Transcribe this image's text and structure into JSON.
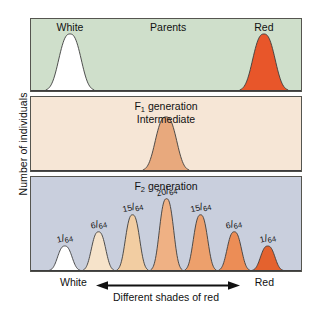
{
  "figure": {
    "y_axis_label": "Number of individuals",
    "x_axis": {
      "left_label": "White",
      "right_label": "Red",
      "caption": "Different shades of red",
      "arrow": "double-headed-arrow"
    }
  },
  "panels": [
    {
      "id": "parents",
      "background": "#cfdfcb",
      "title": "Parents",
      "labels": [
        {
          "text": "White",
          "x_pct": 14.7
        },
        {
          "text": "Parents",
          "x_pct": 50.8
        },
        {
          "text": "Red",
          "x_pct": 86.0
        }
      ],
      "curves": [
        {
          "name": "white-parent-curve",
          "center_pct": 14.7,
          "fill": "#ffffff",
          "height_pct": 78
        },
        {
          "name": "red-parent-curve",
          "center_pct": 86.0,
          "fill": "#e8562a",
          "height_pct": 78
        }
      ]
    },
    {
      "id": "f1",
      "background": "#f6e6d6",
      "title_line1": "F",
      "title_sub1": "1",
      "title_line1_rest": " generation",
      "title_line2": "Intermediate",
      "curves": [
        {
          "name": "f1-intermediate-curve",
          "center_pct": 50.0,
          "fill": "#e8a97d",
          "height_pct": 72
        }
      ]
    },
    {
      "id": "f2",
      "background": "#c9cfdd",
      "title_line1": "F",
      "title_sub1": "2",
      "title_line1_rest": " generation",
      "curves": [
        {
          "name": "f2-curve-1",
          "label_num": "1",
          "label_den": "64",
          "center_pct": 12.8,
          "fill": "#ffffff",
          "height_pct": 26
        },
        {
          "name": "f2-curve-2",
          "label_num": "6",
          "label_den": "64",
          "center_pct": 25.2,
          "fill": "#f6e3ca",
          "height_pct": 41
        },
        {
          "name": "f2-curve-3",
          "label_num": "15",
          "label_den": "64",
          "center_pct": 37.7,
          "fill": "#f2cda2",
          "height_pct": 59
        },
        {
          "name": "f2-curve-4",
          "label_num": "20",
          "label_den": "64",
          "center_pct": 50.2,
          "fill": "#efb184",
          "height_pct": 76
        },
        {
          "name": "f2-curve-5",
          "label_num": "15",
          "label_den": "64",
          "center_pct": 62.7,
          "fill": "#eda06c",
          "height_pct": 59
        },
        {
          "name": "f2-curve-6",
          "label_num": "6",
          "label_den": "64",
          "center_pct": 75.1,
          "fill": "#ec8d56",
          "height_pct": 41
        },
        {
          "name": "f2-curve-7",
          "label_num": "1",
          "label_den": "64",
          "center_pct": 87.4,
          "fill": "#e4622e",
          "height_pct": 26
        }
      ]
    }
  ],
  "chart_data": {
    "type": "area",
    "xlabel": "Different shades of red",
    "ylabel": "Number of individuals",
    "x_axis_endpoints": [
      "White",
      "Red"
    ],
    "series": [
      {
        "name": "Parents",
        "panel": "parents",
        "categories": [
          "White",
          "Red"
        ],
        "values": [
          1,
          1
        ],
        "positions_pct": [
          14.7,
          86.0
        ]
      },
      {
        "name": "F1 generation (Intermediate)",
        "panel": "f1",
        "categories": [
          "Intermediate"
        ],
        "values": [
          1
        ],
        "positions_pct": [
          50.0
        ]
      },
      {
        "name": "F2 generation",
        "panel": "f2",
        "categories": [
          "1/64",
          "6/64",
          "15/64",
          "20/64",
          "15/64",
          "6/64",
          "1/64"
        ],
        "values": [
          1,
          6,
          15,
          20,
          15,
          6,
          1
        ],
        "denominator": 64,
        "positions_pct": [
          12.8,
          25.2,
          37.7,
          50.2,
          62.7,
          75.1,
          87.4
        ]
      }
    ],
    "grid": false,
    "legend": "none"
  }
}
